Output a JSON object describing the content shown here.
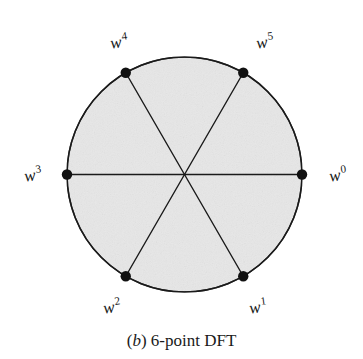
{
  "figure": {
    "caption": {
      "open_paren": "(",
      "letter": "b",
      "close_paren": ")",
      "text": "6-point DFT",
      "full": "(b) 6-point DFT"
    },
    "shape": {
      "name": "circle",
      "fill_color": "#e7e7e7",
      "stroke_color": "#1a1a1a",
      "center_x": 184.5,
      "center_y": 174.5,
      "radius": 117.5
    },
    "vertex_dot": {
      "radius": 5.2,
      "color": "#111111"
    },
    "diameter_line": {
      "color": "#1a1a1a",
      "width": 1.4
    },
    "points": [
      {
        "label_base": "w",
        "exponent": "0",
        "angle_deg": 0,
        "label_x": 338,
        "label_y": 175
      },
      {
        "label_base": "w",
        "exponent": "1",
        "angle_deg": 300,
        "label_x": 258,
        "label_y": 307
      },
      {
        "label_base": "w",
        "exponent": "2",
        "angle_deg": 240,
        "label_x": 112,
        "label_y": 307
      },
      {
        "label_base": "w",
        "exponent": "3",
        "angle_deg": 180,
        "label_x": 33,
        "label_y": 175
      },
      {
        "label_base": "w",
        "exponent": "4",
        "angle_deg": 120,
        "label_x": 119,
        "label_y": 42
      },
      {
        "label_base": "w",
        "exponent": "5",
        "angle_deg": 60,
        "label_x": 265,
        "label_y": 42
      }
    ]
  }
}
